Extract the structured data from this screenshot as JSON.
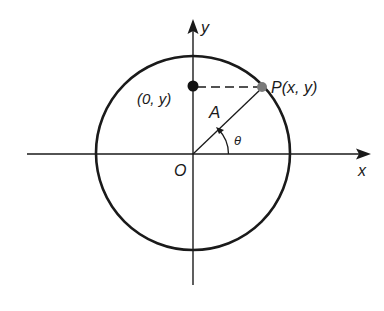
{
  "diagram": {
    "labels": {
      "y_axis": "y",
      "x_axis": "x",
      "origin": "O",
      "point_p": "P(x, y)",
      "point_proj": "(0, y)",
      "radius": "A",
      "angle": "θ"
    },
    "colors": {
      "stroke": "#1a1a1a",
      "point_p_fill": "#7a7a7a",
      "point_proj_fill": "#111111"
    }
  }
}
